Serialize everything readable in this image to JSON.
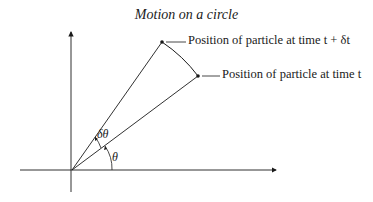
{
  "title": "Motion on a circle",
  "labels": {
    "point_later": "Position of particle at time t + δt",
    "point_now": "Position of particle at time t",
    "angle_small": "δθ",
    "angle_main": "θ"
  },
  "geometry": {
    "origin": [
      72,
      170
    ],
    "point_later": [
      162,
      42
    ],
    "point_now": [
      198,
      76
    ]
  },
  "colors": {
    "ink": "#1a1a1a",
    "background": "#ffffff"
  }
}
